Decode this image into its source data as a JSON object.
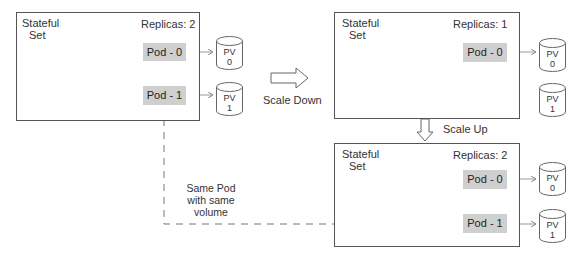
{
  "diagram": {
    "before": {
      "title_line1": "Stateful",
      "title_line2": "Set",
      "replicas": "Replicas: 2",
      "pods": [
        {
          "label": "Pod - 0",
          "pv_line1": "PV",
          "pv_line2": "0"
        },
        {
          "label": "Pod - 1",
          "pv_line1": "PV",
          "pv_line2": "1"
        }
      ]
    },
    "scale_down": {
      "label": "Scale Down"
    },
    "after_scale_down": {
      "title_line1": "Stateful",
      "title_line2": "Set",
      "replicas": "Replicas: 1",
      "pods": [
        {
          "label": "Pod - 0",
          "pv_line1": "PV",
          "pv_line2": "0"
        }
      ],
      "orphan_pv": {
        "pv_line1": "PV",
        "pv_line2": "1"
      }
    },
    "scale_up": {
      "label": "Scale Up"
    },
    "after_scale_up": {
      "title_line1": "Stateful",
      "title_line2": "Set",
      "replicas": "Replicas: 2",
      "pods": [
        {
          "label": "Pod - 0",
          "pv_line1": "PV",
          "pv_line2": "0"
        },
        {
          "label": "Pod - 1",
          "pv_line1": "PV",
          "pv_line2": "1"
        }
      ]
    },
    "annotation": {
      "line1": "Same Pod",
      "line2": "with same",
      "line3": "volume"
    },
    "colors": {
      "pod_fill": "#cfcfcf",
      "border": "#555555",
      "line": "#777777"
    }
  }
}
